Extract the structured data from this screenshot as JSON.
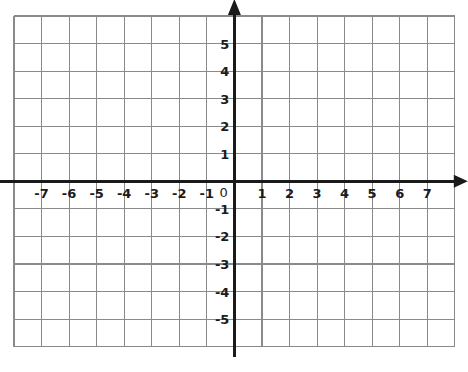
{
  "figure": {
    "kind": "cartesian-coordinate-plane",
    "background_color": "#ffffff",
    "grid_color": "#8a8a8a",
    "axis_color": "#1a1a1a",
    "label_color": "#1b1b1b",
    "origin_label": "0"
  },
  "chart_data": {
    "type": "scatter",
    "title": "",
    "subtitle": "",
    "xlabel": "",
    "ylabel": "",
    "grid": true,
    "legend": null,
    "legend_position": "none",
    "xlim": [
      -8,
      8
    ],
    "ylim": [
      -6,
      6
    ],
    "xtick_step": 1,
    "ytick_step": 1,
    "x_tick_labels": [
      "-7",
      "-6",
      "-5",
      "-4",
      "-3",
      "-2",
      "-1",
      "1",
      "2",
      "3",
      "4",
      "5",
      "6",
      "7"
    ],
    "x_tick_values": [
      -7,
      -6,
      -5,
      -4,
      -3,
      -2,
      -1,
      1,
      2,
      3,
      4,
      5,
      6,
      7
    ],
    "y_tick_labels": [
      "5",
      "4",
      "3",
      "2",
      "1",
      "-1",
      "-2",
      "-3",
      "-4",
      "-5"
    ],
    "y_tick_values": [
      5,
      4,
      3,
      2,
      1,
      -1,
      -2,
      -3,
      -4,
      -5
    ],
    "origin_label": "0",
    "series": [],
    "values": [],
    "x": [],
    "annotations": [],
    "axis_arrows": [
      "x-positive",
      "y-positive"
    ]
  },
  "ticks": {
    "x": [
      {
        "label": "-7",
        "value": -7
      },
      {
        "label": "-6",
        "value": -6
      },
      {
        "label": "-5",
        "value": -5
      },
      {
        "label": "-4",
        "value": -4
      },
      {
        "label": "-3",
        "value": -3
      },
      {
        "label": "-2",
        "value": -2
      },
      {
        "label": "-1",
        "value": -1
      },
      {
        "label": "1",
        "value": 1
      },
      {
        "label": "2",
        "value": 2
      },
      {
        "label": "3",
        "value": 3
      },
      {
        "label": "4",
        "value": 4
      },
      {
        "label": "5",
        "value": 5
      },
      {
        "label": "6",
        "value": 6
      },
      {
        "label": "7",
        "value": 7
      }
    ],
    "y": [
      {
        "label": "5",
        "value": 5
      },
      {
        "label": "4",
        "value": 4
      },
      {
        "label": "3",
        "value": 3
      },
      {
        "label": "2",
        "value": 2
      },
      {
        "label": "1",
        "value": 1
      },
      {
        "label": "-1",
        "value": -1
      },
      {
        "label": "-2",
        "value": -2
      },
      {
        "label": "-3",
        "value": -3
      },
      {
        "label": "-4",
        "value": -4
      },
      {
        "label": "-5",
        "value": -5
      }
    ]
  }
}
